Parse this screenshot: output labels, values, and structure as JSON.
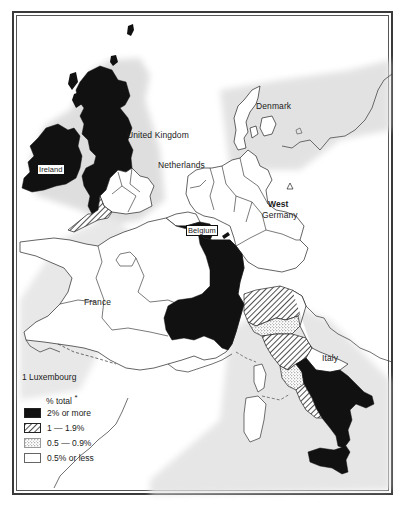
{
  "map": {
    "labels": {
      "united_kingdom": "United Kingdom",
      "ireland": "Ireland",
      "netherlands": "Netherlands",
      "denmark": "Denmark",
      "belgium": "Belgium",
      "west": "West",
      "germany": "Germany",
      "france": "France",
      "italy": "Italy"
    },
    "regions": [
      {
        "country": "Ireland",
        "class": "2% or more"
      },
      {
        "country": "United Kingdom (Scotland, northern and western England)",
        "class": "2% or more"
      },
      {
        "country": "United Kingdom (southern Wales / south-west England)",
        "class": "1 — 1.9%"
      },
      {
        "country": "United Kingdom (south-east England)",
        "class": "0.5% or less"
      },
      {
        "country": "Belgium (southern)",
        "class": "2% or more"
      },
      {
        "country": "France (eastern/south-eastern band)",
        "class": "2% or more"
      },
      {
        "country": "France (rest)",
        "class": "0.5% or less"
      },
      {
        "country": "Netherlands",
        "class": "0.5% or less"
      },
      {
        "country": "Denmark",
        "class": "0.5% or less"
      },
      {
        "country": "West Germany",
        "class": "0.5% or less"
      },
      {
        "country": "Italy (north)",
        "class": "1 — 1.9%"
      },
      {
        "country": "Italy (central)",
        "class": "0.5 — 0.9%"
      },
      {
        "country": "Italy (south and Sicily)",
        "class": "2% or more"
      },
      {
        "country": "Luxembourg",
        "marker": "1"
      }
    ]
  },
  "legend": {
    "footnote_marker": "1",
    "footnote_label": "Luxembourg",
    "title": "% total",
    "title_asterisk": "*",
    "items": [
      {
        "label": "2% or more",
        "pattern": "solid-black",
        "color": "#111111"
      },
      {
        "label": "1 — 1.9%",
        "pattern": "diagonal-hatch",
        "color": "#333333"
      },
      {
        "label": "0.5 — 0.9%",
        "pattern": "stipple",
        "color": "#9a9a9a"
      },
      {
        "label": "0.5% or less",
        "pattern": "white",
        "color": "#ffffff"
      }
    ]
  }
}
